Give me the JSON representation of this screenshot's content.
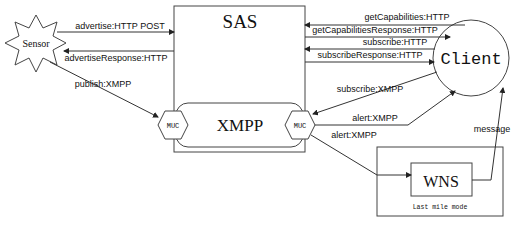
{
  "nodes": {
    "sensor": {
      "label": "Sensor"
    },
    "sas": {
      "label": "SAS"
    },
    "xmpp": {
      "label": "XMPP"
    },
    "muc_left": {
      "label": "MUC"
    },
    "muc_right": {
      "label": "MUC"
    },
    "client": {
      "label": "Client"
    },
    "wns": {
      "label": "WNS"
    },
    "last_mile": {
      "label": "Last mile mode"
    }
  },
  "edges": {
    "advertise": {
      "label": "advertise:HTTP POST",
      "from": "Sensor",
      "to": "SAS"
    },
    "advertise_response": {
      "label": "advertiseResponse:HTTP",
      "from": "SAS",
      "to": "Sensor"
    },
    "publish": {
      "label": "publish:XMPP",
      "from": "Sensor",
      "to": "MUC"
    },
    "get_capabilities": {
      "label": "getCapabilities:HTTP",
      "from": "Client",
      "to": "SAS"
    },
    "get_capabilities_response": {
      "label": "getCapabilitiesResponse:HTTP",
      "from": "SAS",
      "to": "Client"
    },
    "subscribe_http": {
      "label": "subscribe:HTTP",
      "from": "Client",
      "to": "SAS"
    },
    "subscribe_response": {
      "label": "subscribeResponse:HTTP",
      "from": "SAS",
      "to": "Client"
    },
    "subscribe_xmpp": {
      "label": "subscribe:XMPP",
      "from": "Client",
      "to": "MUC"
    },
    "alert_client": {
      "label": "alert:XMPP",
      "from": "MUC",
      "to": "Client"
    },
    "alert_wns": {
      "label": "alert:XMPP",
      "from": "MUC",
      "to": "WNS"
    },
    "message": {
      "label": "message",
      "from": "WNS",
      "to": "Client"
    }
  }
}
